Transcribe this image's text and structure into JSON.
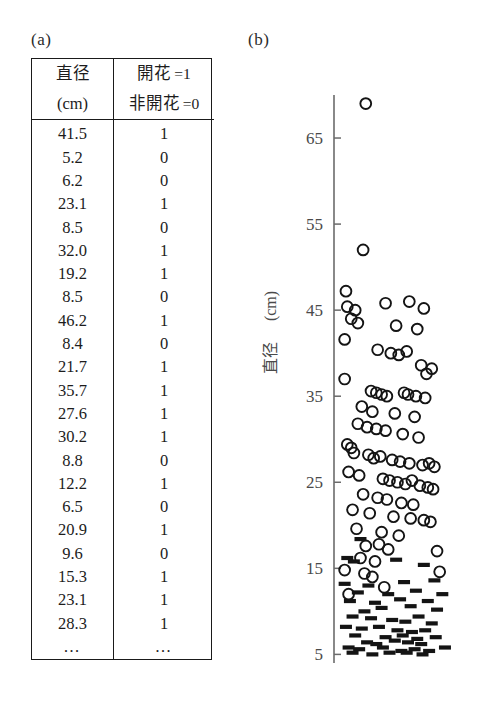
{
  "panels": {
    "a_label": "(a)",
    "b_label": "(b)"
  },
  "table": {
    "header": {
      "col1_line1": "直径",
      "col1_line2": "(cm)",
      "col2_line1_text": "開花",
      "col2_line1_value": "=1",
      "col2_line2_text": "非開花",
      "col2_line2_value": "=0"
    },
    "rows": [
      {
        "diameter": "41.5",
        "flower": "1"
      },
      {
        "diameter": "5.2",
        "flower": "0"
      },
      {
        "diameter": "6.2",
        "flower": "0"
      },
      {
        "diameter": "23.1",
        "flower": "1"
      },
      {
        "diameter": "8.5",
        "flower": "0"
      },
      {
        "diameter": "32.0",
        "flower": "1"
      },
      {
        "diameter": "19.2",
        "flower": "1"
      },
      {
        "diameter": "8.5",
        "flower": "0"
      },
      {
        "diameter": "46.2",
        "flower": "1"
      },
      {
        "diameter": "8.4",
        "flower": "0"
      },
      {
        "diameter": "21.7",
        "flower": "1"
      },
      {
        "diameter": "35.7",
        "flower": "1"
      },
      {
        "diameter": "27.6",
        "flower": "1"
      },
      {
        "diameter": "30.2",
        "flower": "1"
      },
      {
        "diameter": "8.8",
        "flower": "0"
      },
      {
        "diameter": "12.2",
        "flower": "1"
      },
      {
        "diameter": "6.5",
        "flower": "0"
      },
      {
        "diameter": "20.9",
        "flower": "1"
      },
      {
        "diameter": "9.6",
        "flower": "0"
      },
      {
        "diameter": "15.3",
        "flower": "1"
      },
      {
        "diameter": "23.1",
        "flower": "1"
      },
      {
        "diameter": "28.3",
        "flower": "1"
      }
    ],
    "continuation": {
      "diameter": "…",
      "flower": "…"
    }
  },
  "chart_data": {
    "type": "scatter",
    "title": "",
    "xlabel": "",
    "ylabel": "直径 (cm)",
    "ylabel_main": "直径",
    "ylabel_unit": "(cm)",
    "ylim": [
      4,
      70
    ],
    "xlim": [
      0,
      1
    ],
    "yticks": [
      5,
      15,
      25,
      35,
      45,
      55,
      65
    ],
    "ytick_labels": [
      "5",
      "15",
      "25",
      "35",
      "45",
      "55",
      "65"
    ],
    "grid": false,
    "legend": "none",
    "marker_colors": {
      "circle": "#141414",
      "dash": "#141414"
    },
    "series": [
      {
        "name": "開花 =1",
        "marker": "open-circle",
        "points": [
          [
            0.18,
            69.0
          ],
          [
            0.16,
            52.0
          ],
          [
            0.03,
            47.2
          ],
          [
            0.04,
            45.4
          ],
          [
            0.1,
            45.0
          ],
          [
            0.33,
            45.8
          ],
          [
            0.51,
            46.0
          ],
          [
            0.62,
            45.2
          ],
          [
            0.07,
            44.0
          ],
          [
            0.12,
            43.5
          ],
          [
            0.41,
            43.2
          ],
          [
            0.57,
            42.8
          ],
          [
            0.02,
            41.6
          ],
          [
            0.27,
            40.4
          ],
          [
            0.37,
            40.0
          ],
          [
            0.43,
            39.8
          ],
          [
            0.49,
            40.2
          ],
          [
            0.6,
            38.6
          ],
          [
            0.68,
            38.2
          ],
          [
            0.64,
            37.6
          ],
          [
            0.02,
            37.0
          ],
          [
            0.22,
            35.6
          ],
          [
            0.26,
            35.4
          ],
          [
            0.3,
            35.2
          ],
          [
            0.34,
            35.0
          ],
          [
            0.47,
            35.4
          ],
          [
            0.5,
            35.2
          ],
          [
            0.56,
            35.0
          ],
          [
            0.63,
            34.8
          ],
          [
            0.15,
            33.8
          ],
          [
            0.23,
            33.2
          ],
          [
            0.4,
            33.0
          ],
          [
            0.55,
            32.6
          ],
          [
            0.12,
            31.8
          ],
          [
            0.19,
            31.4
          ],
          [
            0.26,
            31.2
          ],
          [
            0.33,
            31.0
          ],
          [
            0.46,
            30.6
          ],
          [
            0.58,
            30.2
          ],
          [
            0.04,
            29.4
          ],
          [
            0.07,
            29.0
          ],
          [
            0.09,
            28.4
          ],
          [
            0.2,
            28.2
          ],
          [
            0.24,
            27.8
          ],
          [
            0.29,
            28.0
          ],
          [
            0.38,
            27.6
          ],
          [
            0.44,
            27.4
          ],
          [
            0.51,
            27.2
          ],
          [
            0.61,
            27.0
          ],
          [
            0.66,
            27.2
          ],
          [
            0.7,
            26.8
          ],
          [
            0.05,
            26.2
          ],
          [
            0.13,
            25.8
          ],
          [
            0.31,
            25.4
          ],
          [
            0.36,
            25.2
          ],
          [
            0.42,
            25.0
          ],
          [
            0.48,
            24.8
          ],
          [
            0.53,
            25.2
          ],
          [
            0.59,
            24.6
          ],
          [
            0.65,
            24.4
          ],
          [
            0.69,
            24.2
          ],
          [
            0.16,
            23.6
          ],
          [
            0.27,
            23.2
          ],
          [
            0.34,
            23.0
          ],
          [
            0.45,
            22.6
          ],
          [
            0.54,
            22.4
          ],
          [
            0.08,
            21.8
          ],
          [
            0.21,
            21.4
          ],
          [
            0.39,
            21.0
          ],
          [
            0.52,
            20.8
          ],
          [
            0.62,
            20.6
          ],
          [
            0.67,
            20.4
          ],
          [
            0.11,
            19.6
          ],
          [
            0.3,
            19.2
          ],
          [
            0.43,
            18.8
          ],
          [
            0.18,
            17.6
          ],
          [
            0.35,
            17.2
          ],
          [
            0.28,
            17.8
          ],
          [
            0.72,
            17.0
          ],
          [
            0.14,
            16.2
          ],
          [
            0.25,
            15.8
          ],
          [
            0.02,
            14.8
          ],
          [
            0.17,
            14.4
          ],
          [
            0.23,
            14.0
          ],
          [
            0.74,
            14.6
          ],
          [
            0.32,
            12.8
          ],
          [
            0.05,
            12.0
          ]
        ]
      },
      {
        "name": "非開花 =0",
        "marker": "dash",
        "points": [
          [
            0.14,
            18.4
          ],
          [
            0.04,
            16.2
          ],
          [
            0.09,
            15.8
          ],
          [
            0.41,
            16.0
          ],
          [
            0.62,
            15.4
          ],
          [
            0.02,
            13.2
          ],
          [
            0.2,
            13.0
          ],
          [
            0.47,
            13.4
          ],
          [
            0.7,
            13.6
          ],
          [
            0.12,
            12.2
          ],
          [
            0.35,
            12.0
          ],
          [
            0.56,
            12.4
          ],
          [
            0.76,
            12.0
          ],
          [
            0.06,
            11.2
          ],
          [
            0.25,
            11.0
          ],
          [
            0.44,
            11.4
          ],
          [
            0.65,
            11.2
          ],
          [
            0.3,
            10.4
          ],
          [
            0.52,
            10.6
          ],
          [
            0.17,
            10.0
          ],
          [
            0.72,
            10.2
          ],
          [
            0.08,
            9.4
          ],
          [
            0.22,
            9.2
          ],
          [
            0.38,
            9.0
          ],
          [
            0.58,
            9.4
          ],
          [
            0.48,
            8.8
          ],
          [
            0.68,
            8.6
          ],
          [
            0.03,
            8.2
          ],
          [
            0.15,
            8.0
          ],
          [
            0.28,
            8.2
          ],
          [
            0.42,
            7.8
          ],
          [
            0.53,
            7.6
          ],
          [
            0.63,
            7.8
          ],
          [
            0.1,
            7.2
          ],
          [
            0.33,
            7.0
          ],
          [
            0.46,
            7.2
          ],
          [
            0.57,
            6.8
          ],
          [
            0.71,
            7.0
          ],
          [
            0.19,
            6.4
          ],
          [
            0.26,
            6.2
          ],
          [
            0.4,
            6.6
          ],
          [
            0.5,
            6.4
          ],
          [
            0.6,
            6.2
          ],
          [
            0.05,
            5.8
          ],
          [
            0.13,
            5.6
          ],
          [
            0.31,
            5.8
          ],
          [
            0.45,
            5.4
          ],
          [
            0.55,
            5.6
          ],
          [
            0.66,
            5.4
          ],
          [
            0.78,
            5.8
          ],
          [
            0.36,
            5.2
          ],
          [
            0.23,
            5.0
          ],
          [
            0.49,
            5.2
          ],
          [
            0.61,
            5.0
          ],
          [
            0.08,
            5.2
          ]
        ]
      }
    ]
  }
}
